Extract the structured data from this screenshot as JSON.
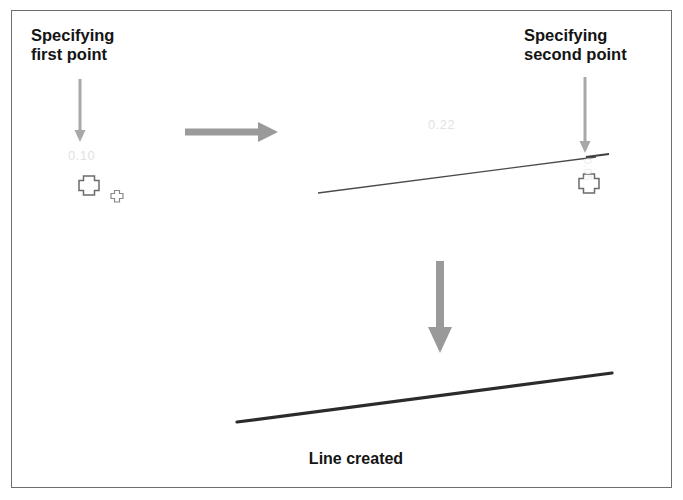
{
  "figure": {
    "width": 683,
    "height": 500,
    "background_color": "#ffffff",
    "border_color": "#6e6e6e"
  },
  "captions": {
    "first_point": "Specifying\nfirst point",
    "second_point": "Specifying\nsecond point",
    "line_created": "Line created"
  },
  "tooltips": {
    "first_point_value": "0.10",
    "second_point_value": "0.22",
    "second_point_vertical": "0.05"
  },
  "colors": {
    "text": "#141414",
    "arrow_gray": "#9a9a9a",
    "arrow_thin_gray": "#a8a8a8",
    "line_preview": "#4a4a4a",
    "line_final": "#2b2b2b",
    "cursor_outline": "#6b6b6b",
    "tooltip_text": "#e2e2e2"
  },
  "graphics": {
    "arrow_first_point": {
      "name": "down-arrow-to-first-point",
      "x": 80,
      "y_start": 79,
      "y_end": 141,
      "thickness": 3,
      "head_width": 11,
      "head_height": 10
    },
    "arrow_second_point": {
      "name": "down-arrow-to-second-point",
      "x": 585,
      "y_start": 77,
      "y_end": 152,
      "thickness": 3,
      "head_width": 11,
      "head_height": 11
    },
    "arrow_right": {
      "name": "right-arrow-step-transition",
      "x_start": 185,
      "x_end": 277,
      "y": 132,
      "thickness": 7,
      "head_width": 15,
      "head_height": 20
    },
    "arrow_down_big": {
      "name": "down-arrow-step-transition",
      "x": 440,
      "y_start": 261,
      "y_end": 352,
      "thickness": 8,
      "head_width": 22,
      "head_height": 26
    },
    "preview_line": {
      "name": "rubber-band-preview-line",
      "x1": 318,
      "y1": 193,
      "x2": 596,
      "y2": 157,
      "width": 1.4
    },
    "preview_line_tail": {
      "name": "preview-line-endpoint-tick",
      "x1": 586,
      "y1": 157,
      "x2": 608,
      "y2": 154,
      "width": 1.6
    },
    "final_line": {
      "name": "created-line",
      "x1": 237,
      "y1": 422,
      "x2": 612,
      "y2": 373,
      "width": 3.2
    },
    "cursor_first": {
      "name": "crosshair-cursor-first-point",
      "cx": 89,
      "cy": 184,
      "size": 17,
      "arm": 5
    },
    "cursor_first_small": {
      "name": "crosshair-cursor-pickbox-small",
      "cx": 117,
      "cy": 196,
      "size": 11,
      "arm": 3
    },
    "cursor_second": {
      "name": "crosshair-cursor-second-point",
      "cx": 589,
      "cy": 182,
      "size": 17,
      "arm": 5
    }
  }
}
